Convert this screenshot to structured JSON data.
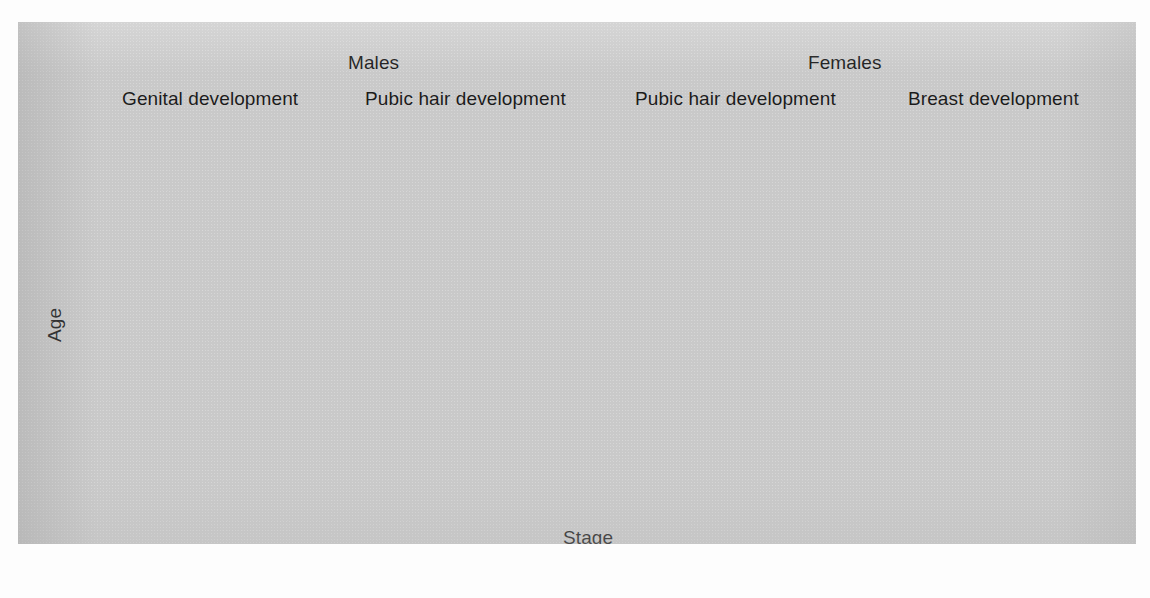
{
  "figure": {
    "background_color": "#c9c9c9",
    "ink_color": "#1b1b1b",
    "axis_color": "#ffffff"
  },
  "groups": [
    {
      "name": "males-group",
      "label": "Males"
    },
    {
      "name": "females-group",
      "label": "Females"
    }
  ],
  "axes": {
    "y_label": "Age",
    "x_label": "Stage",
    "y_ticks": [
      "17",
      "16",
      "15",
      "14",
      "13",
      "12",
      "11",
      "10"
    ],
    "x_ticks": [
      "2",
      "3",
      "4",
      "5"
    ]
  },
  "panels": [
    {
      "title": "Genital development",
      "group": "Males",
      "marker": "filled-circle"
    },
    {
      "title": "Pubic hair development",
      "group": "Males",
      "marker": "filled-circle"
    },
    {
      "title": "Pubic hair development",
      "group": "Females",
      "marker": "open-circle"
    },
    {
      "title": "Breast development",
      "group": "Females",
      "marker": "open-circle"
    }
  ],
  "chart_data": {
    "type": "scatter",
    "xlabel": "Stage",
    "ylabel": "Age",
    "ylim": [
      10,
      17
    ],
    "yticks": [
      10,
      11,
      12,
      13,
      14,
      15,
      16,
      17
    ],
    "categories": [
      "2",
      "3",
      "4",
      "5"
    ],
    "grid": false,
    "legend": "none",
    "error_bars": "range (low to high)",
    "panels": [
      {
        "group": "Males",
        "title": "Genital development",
        "marker": "filled-circle",
        "x": [
          "2",
          "3",
          "4",
          "5"
        ],
        "values": [
          11.6,
          12.8,
          13.7,
          14.9
        ],
        "low": [
          10.6,
          11.8,
          12.7,
          13.85
        ],
        "high": [
          12.6,
          13.95,
          14.8,
          16.0
        ]
      },
      {
        "group": "Males",
        "title": "Pubic hair development",
        "marker": "filled-circle",
        "x": [
          "2",
          "3",
          "4",
          "5"
        ],
        "values": [
          13.4,
          13.9,
          14.35,
          15.1
        ],
        "low": [
          12.4,
          12.85,
          13.3,
          14.15
        ],
        "high": [
          14.5,
          14.95,
          15.45,
          16.2
        ]
      },
      {
        "group": "Females",
        "title": "Pubic hair development",
        "marker": "open-circle",
        "x": [
          "2",
          "3",
          "4",
          "5"
        ],
        "values": [
          11.65,
          12.35,
          12.95,
          14.45
        ],
        "low": [
          10.5,
          11.2,
          11.9,
          13.35
        ],
        "high": [
          12.9,
          13.45,
          14.1,
          15.55
        ]
      },
      {
        "group": "Females",
        "title": "Breast development",
        "marker": "open-circle",
        "x": [
          "2",
          "3",
          "4",
          "5"
        ],
        "values": [
          11.1,
          12.2,
          13.2,
          15.4
        ],
        "low": [
          10.15,
          11.05,
          12.0,
          13.7
        ],
        "high": [
          12.4,
          13.35,
          14.4,
          17.0
        ]
      }
    ]
  }
}
